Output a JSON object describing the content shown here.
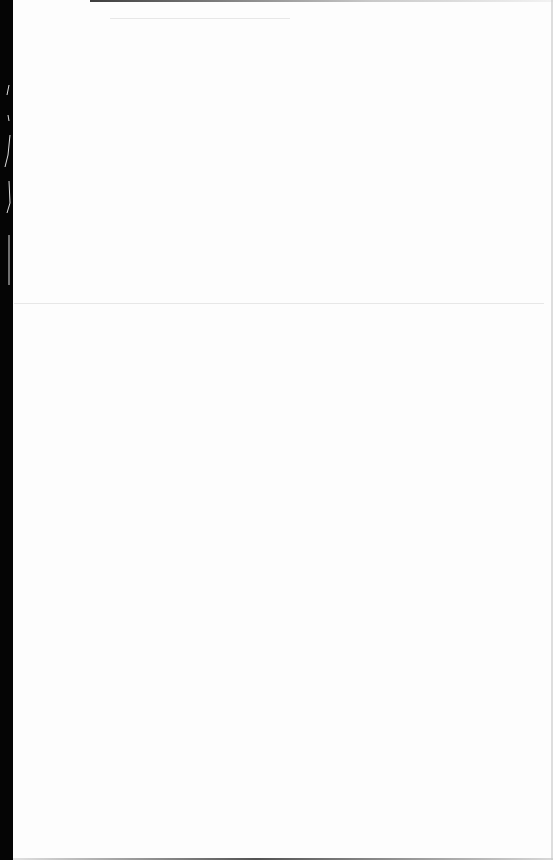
{
  "document": {
    "type": "scanned-page",
    "content": "",
    "colors": {
      "paper": "#fdfdfd",
      "binding": "#050505"
    }
  }
}
